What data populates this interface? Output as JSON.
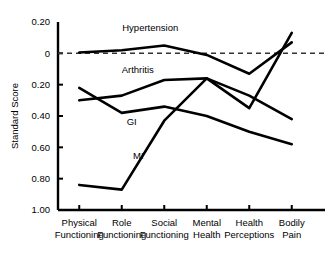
{
  "chart_data": {
    "type": "line",
    "title": "",
    "subtitle": "",
    "xlabel": "",
    "ylabel": "Standard Score",
    "categories": [
      "Physical Functioning",
      "Role Functioning",
      "Social Functioning",
      "Mental Health",
      "Health Perceptions",
      "Bodily Pain"
    ],
    "category_lines": [
      [
        "Physical",
        "Functioning"
      ],
      [
        "Role",
        "Functioning"
      ],
      [
        "Social",
        "Functioning"
      ],
      [
        "Mental",
        "Health"
      ],
      [
        "Health",
        "Perceptions"
      ],
      [
        "Bodily",
        "Pain"
      ]
    ],
    "ylim": [
      -0.2,
      1.0
    ],
    "y_axis_inverted": true,
    "yticks": [
      -0.2,
      0,
      0.2,
      0.4,
      0.6,
      0.8,
      1.0
    ],
    "ytick_labels": [
      "0.20",
      "0",
      "0.20",
      "0.40",
      "0.60",
      "0.80",
      "1.00"
    ],
    "grid": false,
    "legend_position": "inline-annotations",
    "reference_line": {
      "value": 0,
      "style": "dashed",
      "label": ""
    },
    "series": [
      {
        "name": "Hypertension",
        "label": "Hypertension",
        "label_x": "Social Functioning",
        "values": [
          -0.005,
          -0.02,
          -0.05,
          0.01,
          0.13,
          -0.07
        ]
      },
      {
        "name": "Arthritis",
        "label": "Arthritis",
        "label_x": "Role Functioning",
        "values": [
          0.3,
          0.27,
          0.17,
          0.16,
          0.27,
          0.42
        ]
      },
      {
        "name": "GI",
        "label": "GI",
        "label_x": "Role Functioning",
        "values": [
          0.22,
          0.38,
          0.34,
          0.4,
          0.5,
          0.58
        ]
      },
      {
        "name": "MI",
        "label": "MI",
        "label_x": "Social Functioning",
        "values": [
          0.84,
          0.87,
          0.43,
          0.16,
          0.35,
          -0.13
        ]
      }
    ]
  },
  "axes": {
    "y_title": "Standard Score"
  }
}
